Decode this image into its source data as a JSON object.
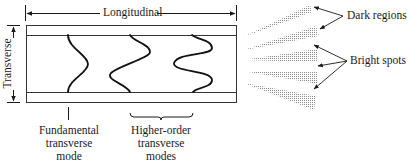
{
  "diagram": {
    "type": "laser cavity transverse modes",
    "labels": {
      "longitudinal": "Longitudinal",
      "transverse": "Transverse",
      "dark_regions": "Dark regions",
      "bright_spots": "Bright spots",
      "fundamental": [
        "Fundamental",
        "transverse",
        "mode"
      ],
      "higher_order": [
        "Higher-order",
        "transverse",
        "modes"
      ]
    },
    "modes": [
      {
        "name": "fundamental",
        "lobes": 1
      },
      {
        "name": "first-order",
        "lobes": 2
      },
      {
        "name": "second-order",
        "lobes": 3
      }
    ],
    "beams": {
      "count": 5,
      "pattern": [
        "dark",
        "dark",
        "bright",
        "bright",
        "bright"
      ]
    },
    "colors": {
      "line": "#1a1a1a",
      "beam": "#9a9a9a"
    }
  }
}
